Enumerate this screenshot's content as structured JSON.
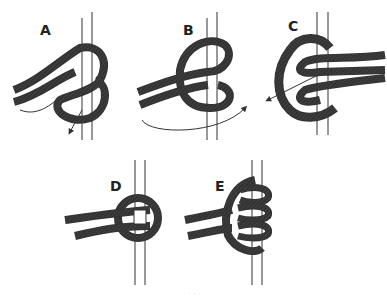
{
  "figure": {
    "type": "knot-tying-steps",
    "panels": [
      {
        "id": "A",
        "label": "A"
      },
      {
        "id": "B",
        "label": "B"
      },
      {
        "id": "C",
        "label": "C"
      },
      {
        "id": "D",
        "label": "D"
      },
      {
        "id": "E",
        "label": "E"
      }
    ],
    "caption": "· · ·",
    "colors": {
      "line": "#333333",
      "hatch": "#555555",
      "background": "#ffffff"
    }
  }
}
